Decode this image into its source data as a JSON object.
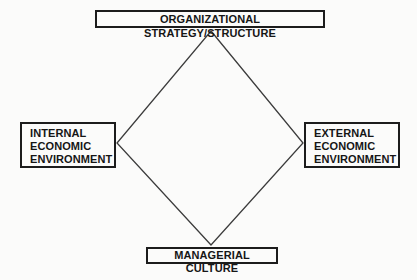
{
  "diagram": {
    "nodes": {
      "top": {
        "label": "ORGANIZATIONAL STRATEGY/STRUCTURE"
      },
      "left": {
        "label": "INTERNAL ECONOMIC ENVIRONMENT",
        "lines": [
          "INTERNAL",
          "ECONOMIC",
          "ENVIRONMENT"
        ]
      },
      "right": {
        "label": "EXTERNAL ECONOMIC ENVIRONMENT",
        "lines": [
          "EXTERNAL",
          "ECONOMIC",
          "ENVIRONMENT"
        ]
      },
      "bottom": {
        "label": "MANAGERIAL CULTURE"
      }
    },
    "colors": {
      "background": "#fbfbfa",
      "box_border": "#1c1c1c",
      "text": "#161616",
      "diamond_line": "#3c3c3c"
    }
  }
}
